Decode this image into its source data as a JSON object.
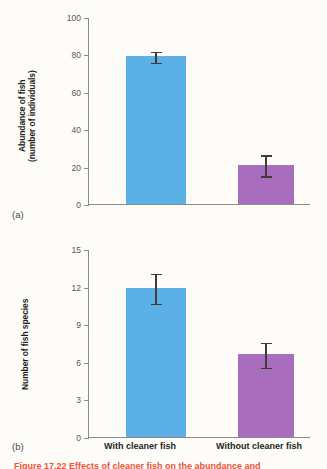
{
  "figure": {
    "panel_a_label": "(a)",
    "panel_b_label": "(b)",
    "caption_partial": "Figure 17.22  Effects of cleaner fish on the abundance and"
  },
  "categories": [
    "With cleaner fish",
    "Without cleaner fish"
  ],
  "colors": {
    "blue": "#5cb0e8",
    "purple": "#a96dbe",
    "axis": "#8d8b86",
    "error": "#3f3b38",
    "caption": "#e8553c"
  },
  "chart_data": [
    {
      "type": "bar",
      "panel": "(a)",
      "title": "",
      "xlabel": "",
      "ylabel": "Abundance of fish\n(number of individuals)",
      "categories": [
        "With cleaner fish",
        "Without cleaner fish"
      ],
      "values": [
        79,
        21
      ],
      "errors": [
        3,
        5.5
      ],
      "ylim": [
        0,
        100
      ],
      "yticks": [
        0,
        20,
        40,
        60,
        80,
        100
      ],
      "ytick_labels": [
        "0",
        "20",
        "40",
        "60",
        "80",
        "100"
      ],
      "grid": false,
      "legend": "none",
      "bar_colors": [
        "#5cb0e8",
        "#a96dbe"
      ]
    },
    {
      "type": "bar",
      "panel": "(b)",
      "title": "",
      "xlabel": "",
      "ylabel": "Number of fish species",
      "categories": [
        "With cleaner fish",
        "Without cleaner fish"
      ],
      "values": [
        11.9,
        6.6
      ],
      "errors": [
        1.2,
        1.0
      ],
      "ylim": [
        0,
        15
      ],
      "yticks": [
        0,
        3,
        6,
        9,
        12,
        15
      ],
      "ytick_labels": [
        "0",
        "3",
        "6",
        "9",
        "12",
        "15"
      ],
      "grid": false,
      "legend": "none",
      "bar_colors": [
        "#5cb0e8",
        "#a96dbe"
      ]
    }
  ]
}
